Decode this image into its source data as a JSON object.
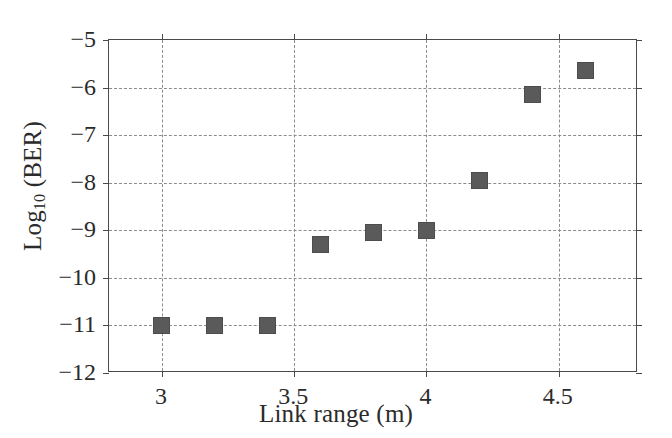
{
  "chart_data": {
    "type": "scatter",
    "title": "",
    "xlabel": "Link range (m)",
    "ylabel": "Log10 (BER)",
    "ylabel_base": "Log",
    "ylabel_sub": "10",
    "ylabel_rest": " (BER)",
    "xlim": [
      2.8,
      4.8
    ],
    "ylim": [
      -12,
      -5
    ],
    "grid": true,
    "legend": null,
    "marker": {
      "shape": "square",
      "color": "#5a5a5a",
      "size_px": 17
    },
    "x_tick_labels": [
      "3",
      "3.5",
      "4",
      "4.5"
    ],
    "x_tick_values": [
      3,
      3.5,
      4,
      4.5
    ],
    "y_tick_labels": [
      "-5",
      "-6",
      "-7",
      "-8",
      "-9",
      "-10",
      "-11",
      "-12"
    ],
    "y_tick_values": [
      -5,
      -6,
      -7,
      -8,
      -9,
      -10,
      -11,
      -12
    ],
    "series": [
      {
        "name": "BER vs link range",
        "x": [
          3.0,
          3.2,
          3.4,
          3.6,
          3.8,
          4.0,
          4.2,
          4.4,
          4.6
        ],
        "y": [
          -11.0,
          -11.0,
          -11.0,
          -9.3,
          -9.05,
          -9.0,
          -7.95,
          -6.15,
          -5.65
        ]
      }
    ]
  },
  "style": {
    "background": "#ffffff",
    "axis_color": "#4a4a4a",
    "grid_color": "#8c8c8c",
    "text_color": "#2b2b2b"
  }
}
